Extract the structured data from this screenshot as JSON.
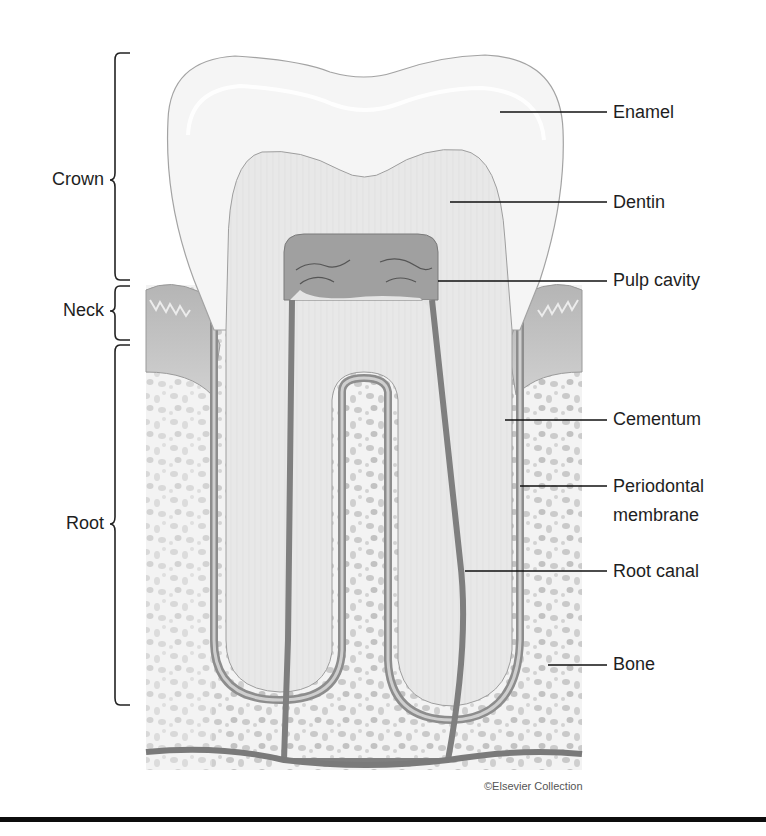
{
  "diagram": {
    "region_labels": [
      {
        "id": "crown",
        "text": "Crown"
      },
      {
        "id": "neck",
        "text": "Neck"
      },
      {
        "id": "root",
        "text": "Root"
      }
    ],
    "part_labels": [
      {
        "id": "enamel",
        "text": "Enamel"
      },
      {
        "id": "dentin",
        "text": "Dentin"
      },
      {
        "id": "pulp-cavity",
        "text": "Pulp cavity"
      },
      {
        "id": "cementum",
        "text": "Cementum"
      },
      {
        "id": "periodontal-membrane",
        "line1": "Periodontal",
        "line2": "membrane"
      },
      {
        "id": "root-canal",
        "text": "Root canal"
      },
      {
        "id": "bone",
        "text": "Bone"
      }
    ],
    "credit": "©Elsevier Collection",
    "colors": {
      "enamel": "#f4f4f4",
      "dentin": "#e6e6e6",
      "pulp": "#9a9a9a",
      "gum": "#bdbdbd",
      "bone_spots": "#c4c4c4",
      "outline": "#8a8a8a",
      "leader": "#111111"
    }
  }
}
